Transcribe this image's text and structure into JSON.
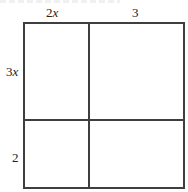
{
  "diagram": {
    "type": "area-model-grid",
    "top_labels": [
      {
        "coef": "2",
        "var": "x"
      },
      {
        "coef": "3",
        "var": ""
      }
    ],
    "side_labels": [
      {
        "coef": "3",
        "var": "x"
      },
      {
        "coef": "2",
        "var": ""
      }
    ],
    "cells": [
      {
        "row": 0,
        "col": 0,
        "value": ""
      },
      {
        "row": 0,
        "col": 1,
        "value": ""
      },
      {
        "row": 1,
        "col": 0,
        "value": ""
      },
      {
        "row": 1,
        "col": 1,
        "value": ""
      }
    ],
    "line_color": "#3f3f3f"
  }
}
